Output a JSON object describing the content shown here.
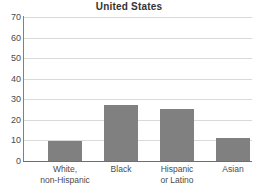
{
  "chart_data": {
    "type": "bar",
    "title": "United States",
    "subtitle": "",
    "xlabel": "",
    "ylabel": "",
    "categories": [
      "White, non-Hispanic",
      "Black",
      "Hispanic or Latino",
      "Asian"
    ],
    "category_lines": [
      [
        "White,",
        "non-Hispanic"
      ],
      [
        "Black",
        ""
      ],
      [
        "Hispanic",
        "or Latino"
      ],
      [
        "Asian",
        ""
      ]
    ],
    "values": [
      9.7,
      27.0,
      25.3,
      11.3
    ],
    "ylim": [
      0,
      70
    ],
    "ytick_values": [
      0,
      10,
      20,
      30,
      40,
      50,
      60,
      70
    ],
    "ytick_labels": [
      "0",
      "10",
      "20",
      "30",
      "40",
      "50",
      "60",
      "70"
    ],
    "ytick_step": 10,
    "grid": true,
    "legend": false,
    "legend_position": "none",
    "bar_color": "#808080",
    "gridline_color": "#d9d9d9",
    "axis_color": "#808080",
    "background_color": "#ffffff",
    "text_color": "#4a4a4a"
  }
}
